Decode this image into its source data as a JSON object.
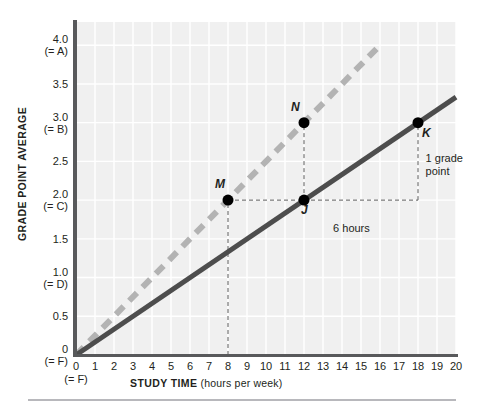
{
  "chart_data": {
    "type": "line",
    "title": "",
    "xlabel_bold": "STUDY TIME",
    "xlabel_sub": "(hours per week)",
    "ylabel": "GRADE POINT AVERAGE",
    "xlim": [
      0,
      20
    ],
    "ylim": [
      0,
      4.3
    ],
    "grid": true,
    "legend": "none",
    "x_ticks": [
      {
        "value": 0,
        "label": "0",
        "sublabel": "(= F)"
      },
      {
        "value": 1,
        "label": "1",
        "sublabel": ""
      },
      {
        "value": 2,
        "label": "2",
        "sublabel": ""
      },
      {
        "value": 3,
        "label": "3",
        "sublabel": ""
      },
      {
        "value": 4,
        "label": "4",
        "sublabel": ""
      },
      {
        "value": 5,
        "label": "5",
        "sublabel": ""
      },
      {
        "value": 6,
        "label": "6",
        "sublabel": ""
      },
      {
        "value": 7,
        "label": "7",
        "sublabel": ""
      },
      {
        "value": 8,
        "label": "8",
        "sublabel": ""
      },
      {
        "value": 9,
        "label": "9",
        "sublabel": ""
      },
      {
        "value": 10,
        "label": "10",
        "sublabel": ""
      },
      {
        "value": 11,
        "label": "11",
        "sublabel": ""
      },
      {
        "value": 12,
        "label": "12",
        "sublabel": ""
      },
      {
        "value": 13,
        "label": "13",
        "sublabel": ""
      },
      {
        "value": 14,
        "label": "14",
        "sublabel": ""
      },
      {
        "value": 15,
        "label": "15",
        "sublabel": ""
      },
      {
        "value": 16,
        "label": "16",
        "sublabel": ""
      },
      {
        "value": 17,
        "label": "17",
        "sublabel": ""
      },
      {
        "value": 18,
        "label": "18",
        "sublabel": ""
      },
      {
        "value": 19,
        "label": "19",
        "sublabel": ""
      },
      {
        "value": 20,
        "label": "20",
        "sublabel": ""
      }
    ],
    "y_ticks": [
      {
        "value": 0.0,
        "label": "0",
        "sublabel": "(= F)"
      },
      {
        "value": 0.5,
        "label": "0.5",
        "sublabel": ""
      },
      {
        "value": 1.0,
        "label": "1.0",
        "sublabel": "(= D)"
      },
      {
        "value": 1.5,
        "label": "1.5",
        "sublabel": ""
      },
      {
        "value": 2.0,
        "label": "2.0",
        "sublabel": "(= C)"
      },
      {
        "value": 2.5,
        "label": "2.5",
        "sublabel": ""
      },
      {
        "value": 3.0,
        "label": "3.0",
        "sublabel": "(= B)"
      },
      {
        "value": 3.5,
        "label": "3.5",
        "sublabel": ""
      },
      {
        "value": 4.0,
        "label": "4.0",
        "sublabel": "(= A)"
      }
    ],
    "series": [
      {
        "name": "dashed-line",
        "style": "dashed",
        "color": "#b3b3b3",
        "slope": 0.25,
        "intercept": 0,
        "x": [
          0,
          16
        ],
        "values": [
          0,
          4.0
        ]
      },
      {
        "name": "solid-line",
        "style": "solid",
        "color": "#4d4d4d",
        "slope": 0.1667,
        "intercept": 0,
        "x": [
          0,
          20
        ],
        "values": [
          0,
          3.33
        ]
      }
    ],
    "points": [
      {
        "label": "M",
        "x": 8,
        "y": 2.0,
        "series": "dashed-line",
        "label_dx": -13,
        "label_dy": -16
      },
      {
        "label": "N",
        "x": 12,
        "y": 3.0,
        "series": "dashed-line",
        "label_dx": -13,
        "label_dy": -16
      },
      {
        "label": "J",
        "x": 12,
        "y": 2.0,
        "series": "solid-line",
        "label_dx": -3,
        "label_dy": 10
      },
      {
        "label": "K",
        "x": 18,
        "y": 3.0,
        "series": "solid-line",
        "label_dx": 4,
        "label_dy": 10
      }
    ],
    "annotations": [
      {
        "name": "run-annotation",
        "text": "6 hours",
        "x": 14.9,
        "y": 1.72
      },
      {
        "name": "rise-annotation",
        "text_line1": "1 grade",
        "text_line2": "point",
        "x": 18.4,
        "y": 2.62
      }
    ],
    "guides": [
      {
        "name": "vertical-guide-8",
        "from": [
          8,
          0
        ],
        "to": [
          8,
          2.0
        ]
      },
      {
        "name": "vertical-guide-12",
        "from": [
          12,
          2.0
        ],
        "to": [
          12,
          3.0
        ]
      },
      {
        "name": "horizontal-guide-M-J",
        "from": [
          8,
          2.0
        ],
        "to": [
          12,
          2.0
        ]
      },
      {
        "name": "horizontal-guide-J-K",
        "from": [
          12,
          2.0
        ],
        "to": [
          18,
          2.0
        ]
      },
      {
        "name": "vertical-guide-18",
        "from": [
          18,
          2.0
        ],
        "to": [
          18,
          3.0
        ]
      }
    ]
  },
  "colors": {
    "plot_background": "#f0f0f0",
    "grid": "#ffffff",
    "axis": "#58595b",
    "dashed_series": "#b3b3b3",
    "solid_series": "#4d4d4d",
    "point": "#000000",
    "text": "#231f20",
    "footer_rule": "#b8b8bc"
  }
}
